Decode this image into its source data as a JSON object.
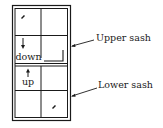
{
  "diagram": {
    "type": "double-hung window",
    "upper_sash": {
      "label": "Upper sash",
      "direction_label": "down",
      "direction_arrow": "arrow-down"
    },
    "lower_sash": {
      "label": "Lower sash",
      "direction_label": "up",
      "direction_arrow": "arrow-up"
    },
    "lock_marks": [
      "upper-left-pane",
      "lower-right-pane"
    ],
    "colors": {
      "line": "#1a1a1a",
      "background": "#ffffff"
    }
  }
}
